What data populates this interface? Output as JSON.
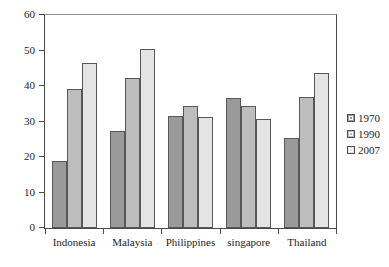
{
  "chart_data": {
    "type": "bar",
    "title": "",
    "subtitle": "",
    "xlabel": "",
    "ylabel": "",
    "categories": [
      "Indonesia",
      "Malaysia",
      "Philippines",
      "singapore",
      "Thailand"
    ],
    "series": [
      {
        "name": "1970",
        "color": "#9a9a9a",
        "values": [
          18.8,
          27.3,
          31.5,
          36.5,
          25.3
        ]
      },
      {
        "name": "1990",
        "color": "#bdbdbd",
        "values": [
          39.2,
          42.2,
          34.3,
          34.4,
          37.0
        ]
      },
      {
        "name": "2007",
        "color": "#e4e4e4",
        "values": [
          46.6,
          50.5,
          31.2,
          30.8,
          43.8
        ]
      }
    ],
    "ylim": [
      0,
      60
    ],
    "yticks": [
      0,
      10,
      20,
      30,
      40,
      50,
      60
    ],
    "ytick_labels": [
      "0",
      "10",
      "20",
      "30",
      "40",
      "50",
      "60"
    ],
    "grid": false,
    "legend_position": "right",
    "legend_entries": [
      "1970",
      "1990",
      "2007"
    ]
  }
}
